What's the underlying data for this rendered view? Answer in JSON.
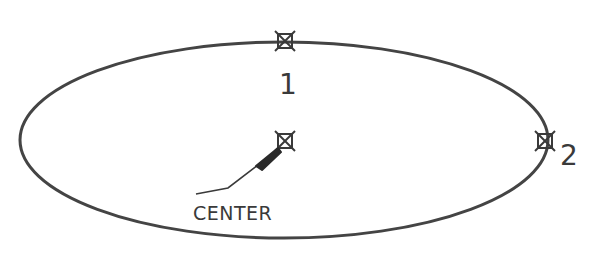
{
  "diagram": {
    "ellipse": {
      "cx": 284,
      "cy": 140,
      "rx": 264,
      "ry": 98,
      "stroke": "#444444"
    },
    "points": [
      {
        "id": "1",
        "label": "1",
        "x": 285,
        "y": 41
      },
      {
        "id": "2",
        "label": "2",
        "x": 545,
        "y": 141
      },
      {
        "id": "center",
        "label": "CENTER",
        "x": 285,
        "y": 141
      }
    ],
    "labels": {
      "point1": "1",
      "point2": "2",
      "center": "CENTER"
    }
  }
}
